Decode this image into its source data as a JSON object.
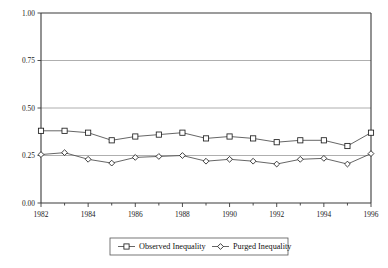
{
  "chart_data": {
    "type": "line",
    "title": "",
    "subtitle": "",
    "xlabel": "",
    "ylabel": "",
    "x": [
      1982,
      1983,
      1984,
      1985,
      1986,
      1987,
      1988,
      1989,
      1990,
      1991,
      1992,
      1993,
      1994,
      1995,
      1996
    ],
    "categories": [
      "1982",
      "1983",
      "1984",
      "1985",
      "1986",
      "1987",
      "1988",
      "1989",
      "1990",
      "1991",
      "1992",
      "1993",
      "1994",
      "1995",
      "1996"
    ],
    "series": [
      {
        "name": "Observed Inequality",
        "marker": "square",
        "values": [
          0.38,
          0.38,
          0.37,
          0.33,
          0.35,
          0.36,
          0.37,
          0.34,
          0.35,
          0.34,
          0.32,
          0.33,
          0.33,
          0.3,
          0.37
        ]
      },
      {
        "name": "Purged Inequality",
        "marker": "diamond",
        "values": [
          0.255,
          0.265,
          0.23,
          0.21,
          0.24,
          0.245,
          0.25,
          0.22,
          0.23,
          0.22,
          0.205,
          0.23,
          0.235,
          0.205,
          0.26
        ]
      }
    ],
    "xlim": [
      1982,
      1996
    ],
    "ylim": [
      0.0,
      1.0
    ],
    "y_ticks": [
      0.0,
      0.25,
      0.5,
      0.75,
      1.0
    ],
    "y_tick_labels": [
      "0.00",
      "0.25",
      "0.50",
      "0.75",
      "1.00"
    ],
    "x_ticks": [
      1982,
      1984,
      1986,
      1988,
      1990,
      1992,
      1994,
      1996
    ],
    "x_tick_labels": [
      "1982",
      "1984",
      "1986",
      "1988",
      "1990",
      "1992",
      "1994",
      "1996"
    ],
    "x_minor_ticks": [
      1983,
      1985,
      1987,
      1989,
      1991,
      1993,
      1995
    ],
    "grid": "horizontal",
    "legend_position": "bottom-center",
    "colors": {
      "line": "#4a4a4a",
      "marker_fill": "#ffffff",
      "marker_stroke": "#1f1f1f",
      "axis": "#3a3a3a",
      "grid": "#9a9a9a",
      "background": "#ffffff",
      "text": "#111111"
    }
  },
  "legend": {
    "items": [
      {
        "label": "Observed Inequality",
        "marker": "square-marker-icon"
      },
      {
        "label": "Purged Inequality",
        "marker": "diamond-marker-icon"
      }
    ]
  }
}
